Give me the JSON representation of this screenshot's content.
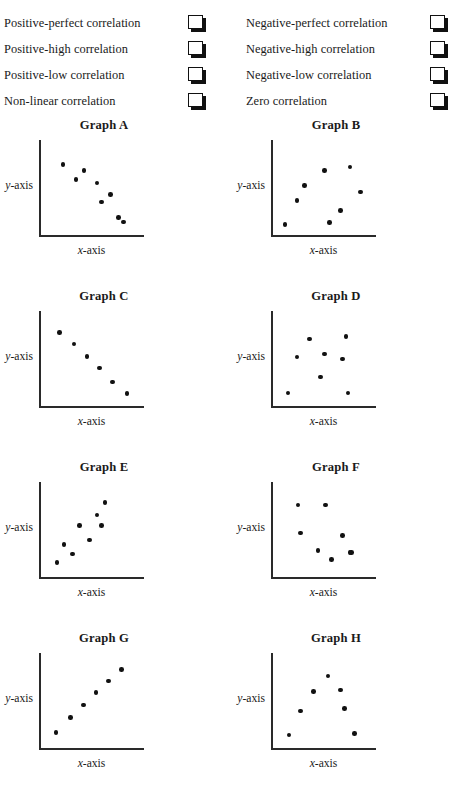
{
  "legend": {
    "left_column": [
      {
        "label": "Positive-perfect correlation",
        "checkbox": "empty-checkbox"
      },
      {
        "label": "Positive-high correlation",
        "checkbox": "empty-checkbox"
      },
      {
        "label": "Positive-low correlation",
        "checkbox": "empty-checkbox"
      },
      {
        "label": "Non-linear correlation",
        "checkbox": "empty-checkbox"
      }
    ],
    "right_column": [
      {
        "label": "Negative-perfect correlation",
        "checkbox": "empty-checkbox"
      },
      {
        "label": "Negative-high correlation",
        "checkbox": "empty-checkbox"
      },
      {
        "label": "Negative-low correlation",
        "checkbox": "empty-checkbox"
      },
      {
        "label": "Zero correlation",
        "checkbox": "empty-checkbox"
      }
    ]
  },
  "axis_labels": {
    "x_italic": "x",
    "x_rest": "-axis",
    "y_italic": "y",
    "y_rest": "-axis"
  },
  "colors": {
    "point": "#111111",
    "axis": "#2a2a2a",
    "text": "#1a1a1a",
    "background": "#ffffff"
  },
  "chart_data": [
    {
      "type": "scatter",
      "title": "Graph A",
      "xlabel": "x-axis",
      "ylabel": "y-axis",
      "xlim": [
        0,
        100
      ],
      "ylim": [
        0,
        100
      ],
      "grid": false,
      "legend": "none",
      "pattern": "negative-high correlation",
      "x": [
        20,
        34,
        43,
        57,
        62,
        72,
        81,
        86
      ],
      "y": [
        80,
        62,
        73,
        58,
        35,
        44,
        16,
        11
      ]
    },
    {
      "type": "scatter",
      "title": "Graph B",
      "xlabel": "x-axis",
      "ylabel": "y-axis",
      "xlim": [
        0,
        100
      ],
      "ylim": [
        0,
        100
      ],
      "grid": false,
      "legend": "none",
      "pattern": "non-linear correlation",
      "x": [
        9,
        22,
        30,
        52,
        58,
        70,
        80,
        92
      ],
      "y": [
        8,
        37,
        55,
        73,
        10,
        25,
        77,
        47
      ]
    },
    {
      "type": "scatter",
      "title": "Graph C",
      "xlabel": "x-axis",
      "ylabel": "y-axis",
      "xlim": [
        0,
        100
      ],
      "ylim": [
        0,
        100
      ],
      "grid": false,
      "legend": "none",
      "pattern": "negative-perfect correlation",
      "x": [
        16,
        32,
        46,
        60,
        74,
        90
      ],
      "y": [
        84,
        70,
        55,
        41,
        24,
        10
      ]
    },
    {
      "type": "scatter",
      "title": "Graph D",
      "xlabel": "x-axis",
      "ylabel": "y-axis",
      "xlim": [
        0,
        100
      ],
      "ylim": [
        0,
        100
      ],
      "grid": false,
      "legend": "none",
      "pattern": "zero correlation",
      "x": [
        12,
        22,
        36,
        48,
        52,
        72,
        76,
        78
      ],
      "y": [
        11,
        54,
        76,
        30,
        58,
        52,
        79,
        11
      ]
    },
    {
      "type": "scatter",
      "title": "Graph E",
      "xlabel": "x-axis",
      "ylabel": "y-axis",
      "xlim": [
        0,
        100
      ],
      "ylim": [
        0,
        100
      ],
      "grid": false,
      "legend": "none",
      "pattern": "positive-high correlation",
      "x": [
        13,
        21,
        30,
        38,
        49,
        57,
        62,
        66
      ],
      "y": [
        13,
        34,
        23,
        57,
        40,
        70,
        57,
        85
      ]
    },
    {
      "type": "scatter",
      "title": "Graph F",
      "xlabel": "x-axis",
      "ylabel": "y-axis",
      "xlim": [
        0,
        100
      ],
      "ylim": [
        0,
        100
      ],
      "grid": false,
      "legend": "none",
      "pattern": "negative-low correlation",
      "x": [
        23,
        26,
        45,
        53,
        60,
        72,
        80,
        82
      ],
      "y": [
        82,
        48,
        27,
        82,
        16,
        45,
        25,
        25
      ]
    },
    {
      "type": "scatter",
      "title": "Graph G",
      "xlabel": "x-axis",
      "ylabel": "y-axis",
      "xlim": [
        0,
        100
      ],
      "ylim": [
        0,
        100
      ],
      "grid": false,
      "legend": "none",
      "pattern": "positive-perfect correlation",
      "x": [
        12,
        28,
        42,
        56,
        70,
        84
      ],
      "y": [
        14,
        32,
        47,
        62,
        76,
        90
      ]
    },
    {
      "type": "scatter",
      "title": "Graph H",
      "xlabel": "x-axis",
      "ylabel": "y-axis",
      "xlim": [
        0,
        100
      ],
      "ylim": [
        0,
        100
      ],
      "grid": false,
      "legend": "none",
      "pattern": "non-linear correlation",
      "x": [
        13,
        26,
        40,
        56,
        70,
        74,
        85
      ],
      "y": [
        11,
        40,
        63,
        82,
        65,
        43,
        13
      ]
    }
  ]
}
